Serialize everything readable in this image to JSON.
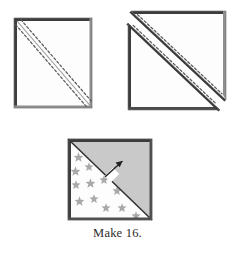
{
  "illustration": {
    "title": "half-square-triangle-piecing-steps",
    "caption": "Make 16.",
    "colors": {
      "fabric_light": "#fdfdfd",
      "fabric_gray": "#c9c9c9",
      "star_gray": "#a8a8a8",
      "edge_dark": "#3a3a3a",
      "edge_mid": "#6e6e6e",
      "stitch_line": "#555555",
      "cut_line": "#4a4a4a",
      "caption_text": "#2b2b2b",
      "background": "#ffffff"
    },
    "steps": [
      {
        "id": "step-1-marked-square",
        "label": "Marked square with drawn diagonal and two stitching lines",
        "shape": "square",
        "x": 14,
        "y": 18,
        "width": 78,
        "height": 90,
        "diagonal": "top-left-to-bottom-right",
        "stitch_lines": 2,
        "stitch_style": "dashed"
      },
      {
        "id": "step-2-cut-triangles",
        "label": "Square cut apart on the drawn line into two stitched triangles",
        "shape": "two-triangles",
        "x": 128,
        "y": 10,
        "width": 98,
        "height": 100,
        "triangles": [
          {
            "id": "upper-right-triangle",
            "stitch_lines": 1
          },
          {
            "id": "lower-left-triangle",
            "stitch_lines": 1
          }
        ],
        "stitch_style": "dashed"
      },
      {
        "id": "step-3-finished-block",
        "label": "Finished half-square-triangle unit pressed toward the dark fabric",
        "shape": "square",
        "x": 68,
        "y": 139,
        "width": 85,
        "height": 81,
        "upper_triangle_fabric": "solid gray",
        "lower_triangle_fabric": "white with gray stars",
        "star_count": 14,
        "press_arrow": {
          "id": "press-direction-arrow",
          "label": "seam pressing direction arrow",
          "points_toward": "upper-right"
        }
      }
    ]
  }
}
